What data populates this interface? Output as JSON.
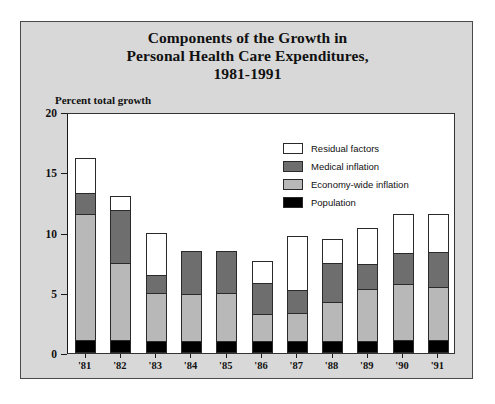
{
  "title": {
    "line1": "Components of the Growth in",
    "line2": "Personal Health Care Expenditures,",
    "line3": "1981-1991"
  },
  "axis": {
    "y_label": "Percent total growth",
    "y_ticks": [
      "0",
      "5",
      "10",
      "15",
      "20"
    ]
  },
  "legend": {
    "items": [
      {
        "label": "Residual factors",
        "color": "#ffffff"
      },
      {
        "label": "Medical inflation",
        "color": "#6e6e6e"
      },
      {
        "label": "Economy-wide inflation",
        "color": "#b8b8b8"
      },
      {
        "label": "Population",
        "color": "#000000"
      }
    ]
  },
  "colors": {
    "panel_background": "#d8d8d8",
    "plot_background": "#ffffff",
    "frame": "#4a4a4a",
    "population": "#000000",
    "economy_wide_inflation": "#b8b8b8",
    "medical_inflation": "#6e6e6e",
    "residual_factors": "#ffffff"
  },
  "chart_data": {
    "type": "bar",
    "stacked": true,
    "title": "Components of the Growth in Personal Health Care Expenditures, 1981-1991",
    "xlabel": "",
    "ylabel": "Percent total growth",
    "ylim": [
      0,
      20
    ],
    "yticks": [
      0,
      5,
      10,
      15,
      20
    ],
    "grid": false,
    "legend_position": "top-center-inside",
    "categories": [
      "'81",
      "'82",
      "'83",
      "'84",
      "'85",
      "'86",
      "'87",
      "'88",
      "'89",
      "'90",
      "'91"
    ],
    "series": [
      {
        "name": "Population",
        "color": "#000000",
        "values": [
          1.1,
          1.1,
          1.0,
          1.0,
          1.0,
          1.0,
          1.0,
          1.0,
          1.0,
          1.1,
          1.1
        ]
      },
      {
        "name": "Economy-wide inflation",
        "color": "#b8b8b8",
        "values": [
          10.4,
          6.4,
          4.0,
          3.9,
          4.0,
          2.2,
          2.3,
          3.2,
          4.3,
          4.6,
          4.4
        ]
      },
      {
        "name": "Medical inflation",
        "color": "#6e6e6e",
        "values": [
          1.8,
          4.4,
          1.5,
          3.6,
          3.5,
          2.6,
          1.9,
          3.3,
          2.1,
          2.6,
          2.9
        ]
      },
      {
        "name": "Residual factors",
        "color": "#ffffff",
        "values": [
          2.9,
          1.1,
          3.5,
          0.0,
          0.0,
          1.8,
          4.5,
          2.0,
          3.0,
          3.2,
          3.1
        ]
      }
    ],
    "totals": [
      16.2,
      13.0,
      10.0,
      8.5,
      8.5,
      7.6,
      9.7,
      9.5,
      10.4,
      11.5,
      11.5
    ]
  }
}
